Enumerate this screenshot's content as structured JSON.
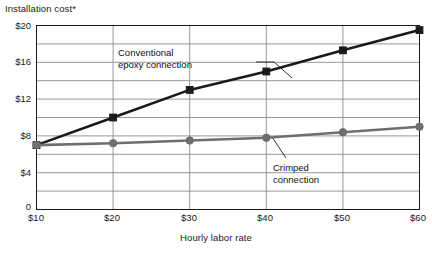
{
  "chart_data": {
    "type": "line",
    "title": "Installation cost*",
    "xlabel": "Hourly labor rate",
    "ylabel": "Installation cost*",
    "x": [
      10,
      20,
      30,
      40,
      50,
      60
    ],
    "xtick_labels": [
      "$10",
      "$20",
      "$30",
      "$40",
      "$50",
      "$60"
    ],
    "ytick_labels": [
      "$20",
      "$16",
      "$12",
      "$8",
      "$4",
      "0"
    ],
    "ytick_values": [
      20,
      16,
      12,
      8,
      4,
      0
    ],
    "xlim": [
      10,
      60
    ],
    "ylim": [
      0,
      20
    ],
    "grid": "both",
    "gridline_step": 2,
    "legend_position": "annotations",
    "series": [
      {
        "name": "Conventional epoxy connection",
        "marker": "square",
        "color": "#1a1a1a",
        "values": [
          7.0,
          10.0,
          13.0,
          15.0,
          17.3,
          19.5
        ]
      },
      {
        "name": "Crimped connection",
        "marker": "circle",
        "color": "#6e6e6e",
        "values": [
          7.0,
          7.2,
          7.5,
          7.8,
          8.4,
          9.0
        ]
      }
    ],
    "annotations": [
      {
        "id": "conventional",
        "line1": "Conventional",
        "line2": "epoxy connection"
      },
      {
        "id": "crimped",
        "line1": "Crimped",
        "line2": "connection"
      }
    ]
  },
  "colors": {
    "series_conventional": "#1a1a1a",
    "series_crimped": "#6e6e6e",
    "gridline": "#8c8c8c",
    "axis": "#1a1a1a",
    "background": "#ffffff"
  }
}
